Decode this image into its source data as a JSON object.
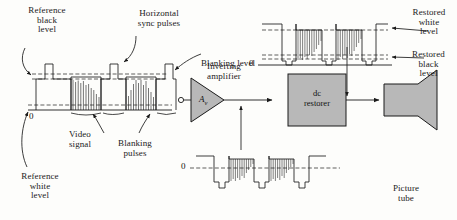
{
  "figure": {
    "background_color": "#fdfdfb",
    "line_color": "#1a1a1a",
    "block_fill": "#b8b8b8"
  },
  "labels": {
    "reference_black_level": "Reference\nblack\nlevel",
    "horizontal_sync_pulses": "Horizontal\nsync pulses",
    "blanking_level": "Blanking level",
    "video_signal": "Video\nsignal",
    "blanking_pulses": "Blanking\npulses",
    "reference_white_level": "Reference\nwhite\nlevel",
    "inverting_amplifier": "Inverting\namplifier",
    "amplifier_gain": "A",
    "amplifier_gain_sub": "v",
    "dc_restorer": "dc\nrestorer",
    "picture_tube": "Picture\ntube",
    "restored_white_level": "Restored\nwhite\nlevel",
    "restored_black_level": "Restored\nblack\nlevel",
    "zero_input": "0",
    "zero_top_right": "0",
    "zero_bottom_mid": "0"
  },
  "blocks": [
    {
      "name": "inverting-amplifier",
      "shape": "triangle",
      "label": "A"
    },
    {
      "name": "dc-restorer",
      "shape": "rectangle",
      "label": "dc restorer"
    },
    {
      "name": "picture-tube",
      "shape": "crt",
      "label": "Picture tube"
    }
  ],
  "waveforms": [
    {
      "name": "input-composite-video",
      "position": "left",
      "polarity": "sync-positive",
      "levels": [
        "Reference black level",
        "Blanking level",
        "Reference white level",
        "0"
      ],
      "sync_pulse_count": 3,
      "video_burst_count": 2
    },
    {
      "name": "amplified-inverted-video",
      "position": "bottom-middle",
      "polarity": "sync-negative",
      "levels": [
        "0"
      ],
      "sync_pulse_count": 3,
      "video_burst_count": 2
    },
    {
      "name": "dc-restored-video",
      "position": "top-right",
      "polarity": "sync-negative-clamped",
      "levels": [
        "Restored white level",
        "Restored black level",
        "0"
      ],
      "sync_pulse_count": 3,
      "video_burst_count": 2
    }
  ]
}
